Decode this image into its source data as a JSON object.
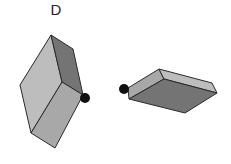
{
  "figure": {
    "label": "D"
  },
  "objects": [
    {
      "name": "left-slab",
      "orientation": "tilted upright",
      "marker": "black dot at right corner"
    },
    {
      "name": "right-slab",
      "orientation": "lying flat",
      "marker": "black dot at left corner"
    }
  ],
  "colors": {
    "light_face": "#bdbdbd",
    "mid_face": "#a8a8a8",
    "dark_face": "#747474",
    "edge": "#2a2a2a",
    "dot": "#111111"
  }
}
